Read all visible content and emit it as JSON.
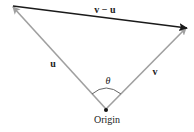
{
  "diagram": {
    "vectors": [
      {
        "name": "u",
        "label": "u",
        "from": "Origin",
        "color": "#a0a0a0"
      },
      {
        "name": "v",
        "label": "v",
        "from": "Origin",
        "color": "#a0a0a0"
      },
      {
        "name": "v-u",
        "label": "v − u",
        "color": "#1a1a1a"
      }
    ],
    "angle_label": "θ",
    "origin_label": "Origin"
  }
}
